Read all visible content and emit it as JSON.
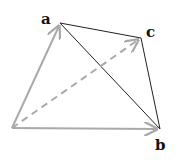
{
  "diagram": {
    "type": "vector-triangle",
    "points": {
      "origin": {
        "x": 12,
        "y": 128
      },
      "a": {
        "x": 60,
        "y": 23
      },
      "b": {
        "x": 160,
        "y": 129
      },
      "c": {
        "x": 141,
        "y": 38
      }
    },
    "labels": {
      "a": "a",
      "b": "b",
      "c": "c"
    },
    "colors": {
      "vector": "#a9a9a9",
      "edge": "#222222",
      "label": "#111111"
    }
  }
}
